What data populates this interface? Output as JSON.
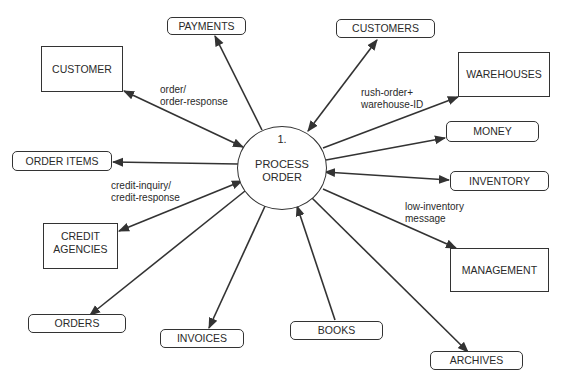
{
  "diagram": {
    "type": "data-flow-diagram",
    "process": {
      "number": "1.",
      "name_line1": "PROCESS",
      "name_line2": "ORDER"
    },
    "external_entities": {
      "customer": "CUSTOMER",
      "warehouses": "WAREHOUSES",
      "credit_agencies_line1": "CREDIT",
      "credit_agencies_line2": "AGENCIES",
      "management": "MANAGEMENT"
    },
    "data_stores": {
      "payments": "PAYMENTS",
      "customers": "CUSTOMERS",
      "order_items": "ORDER ITEMS",
      "money": "MONEY",
      "inventory": "INVENTORY",
      "orders": "ORDERS",
      "invoices": "INVOICES",
      "books": "BOOKS",
      "archives": "ARCHIVES"
    },
    "flow_labels": {
      "order_line1": "order/",
      "order_line2": "order-response",
      "rush_line1": "rush-order+",
      "rush_line2": "warehouse-ID",
      "credit_line1": "credit-inquiry/",
      "credit_line2": "credit-response",
      "lowinv_line1": "low-inventory",
      "lowinv_line2": "message"
    },
    "flows": [
      {
        "from": "PROCESS ORDER",
        "to": "PAYMENTS",
        "direction": "to-store"
      },
      {
        "from": "CUSTOMER",
        "to": "PROCESS ORDER",
        "direction": "bidirectional",
        "label": "order/order-response"
      },
      {
        "from": "PROCESS ORDER",
        "to": "CUSTOMERS",
        "direction": "bidirectional"
      },
      {
        "from": "PROCESS ORDER",
        "to": "WAREHOUSES",
        "direction": "to-entity",
        "label": "rush-order+warehouse-ID"
      },
      {
        "from": "PROCESS ORDER",
        "to": "MONEY",
        "direction": "to-store"
      },
      {
        "from": "PROCESS ORDER",
        "to": "INVENTORY",
        "direction": "bidirectional"
      },
      {
        "from": "PROCESS ORDER",
        "to": "ORDER ITEMS",
        "direction": "to-store"
      },
      {
        "from": "CREDIT AGENCIES",
        "to": "PROCESS ORDER",
        "direction": "bidirectional",
        "label": "credit-inquiry/credit-response"
      },
      {
        "from": "PROCESS ORDER",
        "to": "MANAGEMENT",
        "direction": "to-entity",
        "label": "low-inventory message"
      },
      {
        "from": "PROCESS ORDER",
        "to": "ORDERS",
        "direction": "to-store"
      },
      {
        "from": "PROCESS ORDER",
        "to": "INVOICES",
        "direction": "to-store"
      },
      {
        "from": "BOOKS",
        "to": "PROCESS ORDER",
        "direction": "to-process"
      },
      {
        "from": "PROCESS ORDER",
        "to": "ARCHIVES",
        "direction": "to-store"
      }
    ],
    "colors": {
      "line": "#333333",
      "text": "#2a2a2a",
      "background": "#ffffff"
    }
  }
}
